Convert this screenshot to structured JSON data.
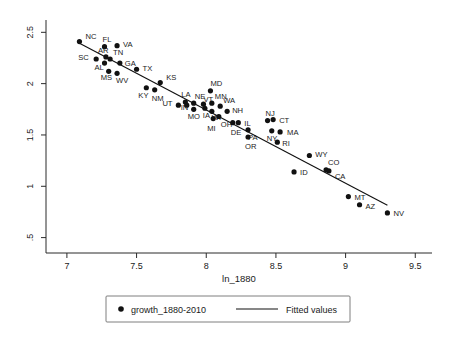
{
  "chart_data": {
    "type": "scatter",
    "title": "",
    "xlabel": "ln_1880",
    "ylabel": "",
    "xlim": [
      6.85,
      9.62
    ],
    "ylim": [
      0.35,
      2.62
    ],
    "xticks": [
      "7",
      "7.5",
      "8",
      "8.5",
      "9",
      "9.5"
    ],
    "xtick_values": [
      7,
      7.5,
      8,
      8.5,
      9,
      9.5
    ],
    "yticks": [
      "2.5",
      "2",
      "1.5",
      "1",
      ".5"
    ],
    "ytick_values": [
      2.5,
      2,
      1.5,
      1,
      0.5
    ],
    "grid": false,
    "legend_position": "bottom",
    "legend": [
      {
        "label": "growth_1880-2010",
        "marker": "dot"
      },
      {
        "label": "Fitted values",
        "marker": "line"
      }
    ],
    "series": [
      {
        "name": "growth_1880-2010",
        "points": [
          {
            "label": "NC",
            "x": 7.09,
            "y": 2.41,
            "lx": 6,
            "ly": -3
          },
          {
            "label": "FL",
            "x": 7.27,
            "y": 2.36,
            "lx": -2,
            "ly": -5
          },
          {
            "label": "VA",
            "x": 7.36,
            "y": 2.37,
            "lx": 6,
            "ly": 1
          },
          {
            "label": "SC",
            "x": 7.21,
            "y": 2.24,
            "lx": -18,
            "ly": 1
          },
          {
            "label": "AR",
            "x": 7.28,
            "y": 2.26,
            "lx": -8,
            "ly": -4
          },
          {
            "label": "TN",
            "x": 7.31,
            "y": 2.24,
            "lx": 3,
            "ly": -4
          },
          {
            "label": "AL",
            "x": 7.27,
            "y": 2.2,
            "lx": -10,
            "ly": 7
          },
          {
            "label": "GA",
            "x": 7.38,
            "y": 2.2,
            "lx": 5,
            "ly": 3
          },
          {
            "label": "MS",
            "x": 7.3,
            "y": 2.12,
            "lx": -8,
            "ly": 9
          },
          {
            "label": "WV",
            "x": 7.36,
            "y": 2.1,
            "lx": -1,
            "ly": 10
          },
          {
            "label": "TX",
            "x": 7.5,
            "y": 2.14,
            "lx": 6,
            "ly": 2
          },
          {
            "label": "KS",
            "x": 7.67,
            "y": 2.01,
            "lx": 6,
            "ly": -3
          },
          {
            "label": "KY",
            "x": 7.57,
            "y": 1.96,
            "lx": -8,
            "ly": 10
          },
          {
            "label": "NM",
            "x": 7.63,
            "y": 1.94,
            "lx": -3,
            "ly": 11
          },
          {
            "label": "UT",
            "x": 7.8,
            "y": 1.79,
            "lx": -16,
            "ly": 1
          },
          {
            "label": "LA",
            "x": 7.85,
            "y": 1.82,
            "lx": -4,
            "ly": -5
          },
          {
            "label": "IN",
            "x": 7.86,
            "y": 1.79,
            "lx": -6,
            "ly": 5
          },
          {
            "label": "NE",
            "x": 7.91,
            "y": 1.81,
            "lx": 1,
            "ly": -4
          },
          {
            "label": "MO",
            "x": 7.91,
            "y": 1.75,
            "lx": -6,
            "ly": 10
          },
          {
            "label": "VT",
            "x": 7.98,
            "y": 1.8,
            "lx": 0,
            "ly": -2
          },
          {
            "label": "IA",
            "x": 7.99,
            "y": 1.76,
            "lx": -2,
            "ly": 10
          },
          {
            "label": "MD",
            "x": 8.03,
            "y": 1.93,
            "lx": 0,
            "ly": -5
          },
          {
            "label": "MN",
            "x": 8.04,
            "y": 1.81,
            "lx": 3,
            "ly": -4
          },
          {
            "label": "WI",
            "x": 8.04,
            "y": 1.73,
            "lx": 0,
            "ly": 9
          },
          {
            "label": "MI",
            "x": 8.05,
            "y": 1.66,
            "lx": -6,
            "ly": 12
          },
          {
            "label": "WA",
            "x": 8.1,
            "y": 1.78,
            "lx": 3,
            "ly": -3
          },
          {
            "label": "OH",
            "x": 8.09,
            "y": 1.68,
            "lx": 2,
            "ly": 11
          },
          {
            "label": "NH",
            "x": 8.15,
            "y": 1.73,
            "lx": 5,
            "ly": 2
          },
          {
            "label": "DE",
            "x": 8.19,
            "y": 1.62,
            "lx": -2,
            "ly": 12
          },
          {
            "label": "IL",
            "x": 8.23,
            "y": 1.62,
            "lx": 6,
            "ly": 3
          },
          {
            "label": "PA",
            "x": 8.3,
            "y": 1.55,
            "lx": 0,
            "ly": 10
          },
          {
            "label": "OR",
            "x": 8.3,
            "y": 1.48,
            "lx": -3,
            "ly": 12
          },
          {
            "label": "NJ",
            "x": 8.44,
            "y": 1.64,
            "lx": -2,
            "ly": -5
          },
          {
            "label": "CT",
            "x": 8.48,
            "y": 1.65,
            "lx": 6,
            "ly": 3
          },
          {
            "label": "NY",
            "x": 8.47,
            "y": 1.54,
            "lx": -5,
            "ly": 10
          },
          {
            "label": "MA",
            "x": 8.53,
            "y": 1.53,
            "lx": 7,
            "ly": 3
          },
          {
            "label": "RI",
            "x": 8.51,
            "y": 1.43,
            "lx": 5,
            "ly": 4
          },
          {
            "label": "WY",
            "x": 8.74,
            "y": 1.3,
            "lx": 6,
            "ly": 2
          },
          {
            "label": "ID",
            "x": 8.63,
            "y": 1.14,
            "lx": 6,
            "ly": 3
          },
          {
            "label": "CO",
            "x": 8.86,
            "y": 1.16,
            "lx": 2,
            "ly": -5
          },
          {
            "label": "CA",
            "x": 8.88,
            "y": 1.15,
            "lx": 6,
            "ly": 8
          },
          {
            "label": "MT",
            "x": 9.02,
            "y": 0.9,
            "lx": 6,
            "ly": 3
          },
          {
            "label": "AZ",
            "x": 9.1,
            "y": 0.82,
            "lx": 6,
            "ly": 4
          },
          {
            "label": "NV",
            "x": 9.3,
            "y": 0.74,
            "lx": 6,
            "ly": 3
          }
        ]
      }
    ],
    "fitted_line": {
      "name": "Fitted values",
      "x1": 7.08,
      "y1": 2.4,
      "x2": 9.3,
      "y2": 0.815
    }
  }
}
